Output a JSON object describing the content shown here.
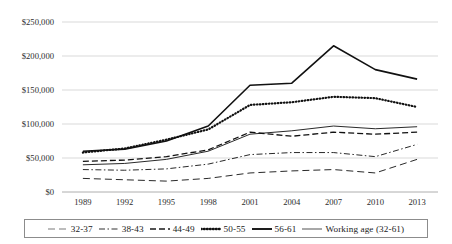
{
  "chart_data": {
    "type": "line",
    "title": "",
    "xlabel": "",
    "ylabel": "",
    "categories": [
      "1989",
      "1992",
      "1995",
      "1998",
      "2001",
      "2004",
      "2007",
      "2010",
      "2013"
    ],
    "ylim": [
      0,
      250000
    ],
    "ytick_labels": [
      "$250,000",
      "$200,000",
      "$150,000",
      "$100,000",
      "$50,000",
      "$0"
    ],
    "ytick_values": [
      250000,
      200000,
      150000,
      100000,
      50000,
      0
    ],
    "grid": true,
    "legend_position": "bottom",
    "series": [
      {
        "name": "32-37",
        "style": "long-dash",
        "values": [
          20000,
          18000,
          16000,
          20000,
          28000,
          31000,
          33000,
          28000,
          48000
        ]
      },
      {
        "name": "38-43",
        "style": "dash-dot",
        "values": [
          33000,
          32000,
          34000,
          41000,
          55000,
          58000,
          58000,
          52000,
          70000
        ]
      },
      {
        "name": "44-49",
        "style": "dashed",
        "values": [
          45000,
          47000,
          52000,
          62000,
          88000,
          82000,
          88000,
          85000,
          88000
        ]
      },
      {
        "name": "50-55",
        "style": "dotted",
        "values": [
          58000,
          64000,
          77000,
          92000,
          128000,
          132000,
          140000,
          138000,
          125000
        ]
      },
      {
        "name": "56-61",
        "style": "solid-thick",
        "values": [
          60000,
          63000,
          75000,
          97000,
          157000,
          160000,
          215000,
          180000,
          166000
        ]
      },
      {
        "name": "Working age (32-61)",
        "style": "solid-thin",
        "values": [
          40000,
          42000,
          48000,
          60000,
          85000,
          90000,
          97000,
          93000,
          96000
        ]
      }
    ]
  },
  "legend": {
    "items": [
      {
        "label": "32-37"
      },
      {
        "label": "38-43"
      },
      {
        "label": "44-49"
      },
      {
        "label": "50-55"
      },
      {
        "label": "56-61"
      },
      {
        "label": "Working age (32-61)"
      }
    ]
  }
}
